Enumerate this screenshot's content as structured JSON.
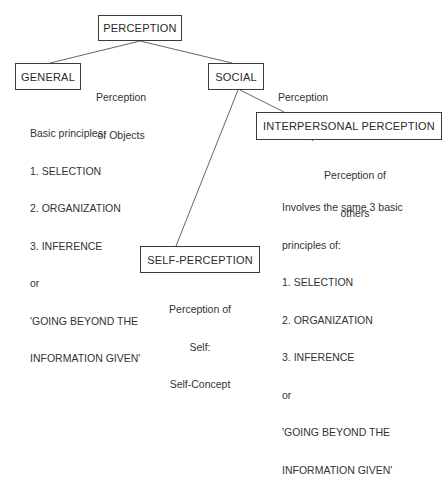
{
  "diagram": {
    "root": {
      "label": "PERCEPTION"
    },
    "general": {
      "label": "GENERAL",
      "caption": [
        "Perception",
        "of Objects"
      ],
      "principles": [
        "Basic principles:",
        "1. SELECTION",
        "2. ORGANIZATION",
        "3. INFERENCE",
        "or",
        "'GOING BEYOND THE",
        "INFORMATION GIVEN'"
      ]
    },
    "social": {
      "label": "SOCIAL",
      "caption": [
        "Perception",
        "of People"
      ]
    },
    "interpersonal": {
      "label": "INTERPERSONAL PERCEPTION",
      "caption": [
        "Perception of",
        "others"
      ],
      "principles": [
        "Involves the same 3 basic",
        "principles of:",
        "1. SELECTION",
        "2. ORGANIZATION",
        "3. INFERENCE",
        "or",
        "'GOING BEYOND THE",
        "INFORMATION GIVEN'"
      ]
    },
    "self": {
      "label": "SELF-PERCEPTION",
      "caption": [
        "Perception of",
        "Self:",
        "Self-Concept"
      ]
    },
    "edges": [
      {
        "from": "PERCEPTION",
        "to": "GENERAL"
      },
      {
        "from": "PERCEPTION",
        "to": "SOCIAL"
      },
      {
        "from": "SOCIAL",
        "to": "INTERPERSONAL PERCEPTION"
      },
      {
        "from": "SOCIAL",
        "to": "SELF-PERCEPTION"
      }
    ],
    "colors": {
      "ink": "#2a2a2a",
      "background": "#ffffff"
    }
  }
}
